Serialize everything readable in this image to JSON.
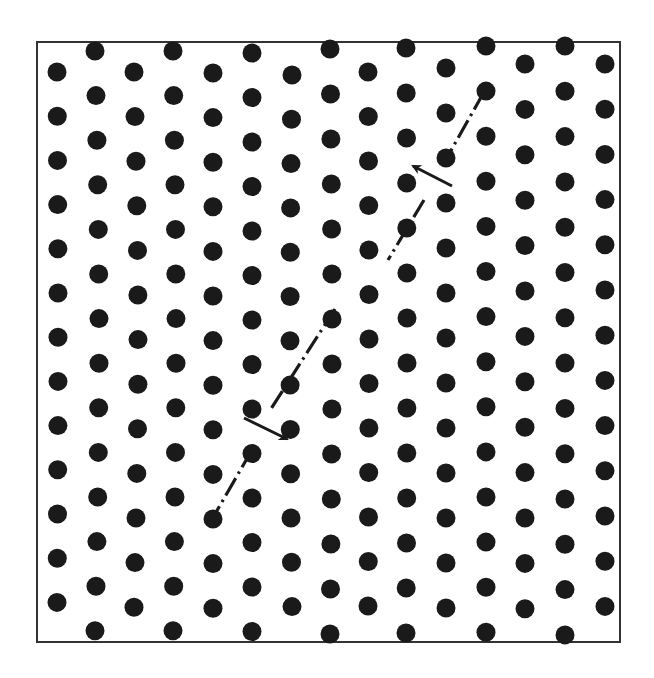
{
  "figure": {
    "frame": {
      "x": 37,
      "y": 42,
      "width": 583,
      "height": 600
    },
    "colors": {
      "ink": "#1a1a1a",
      "background": "#ffffff",
      "frame": "#333333"
    },
    "dot_radius": 9.5,
    "columns": [
      {
        "x": 57,
        "y0": 72,
        "count": 13,
        "dy": 44.2,
        "drift": 1.0
      },
      {
        "x": 95,
        "y0": 51,
        "count": 14,
        "dy": 44.6,
        "drift": 4.0
      },
      {
        "x": 134,
        "y0": 72,
        "count": 13,
        "dy": 44.6,
        "drift": 4.0
      },
      {
        "x": 173,
        "y0": 51,
        "count": 14,
        "dy": 44.6,
        "drift": 3.0
      },
      {
        "x": 213,
        "y0": 73,
        "count": 13,
        "dy": 44.6,
        "drift": 0.0
      },
      {
        "x": 252,
        "y0": 53,
        "count": 14,
        "dy": 44.5,
        "drift": 0.0
      },
      {
        "x": 292,
        "y0": 75,
        "count": 13,
        "dy": 44.3,
        "drift": -2.0
      },
      {
        "x": 330,
        "y0": 49,
        "count": 14,
        "dy": 45.0,
        "drift": 2.0
      },
      {
        "x": 368,
        "y0": 72,
        "count": 13,
        "dy": 44.5,
        "drift": 1.0
      },
      {
        "x": 406,
        "y0": 48,
        "count": 14,
        "dy": 45.0,
        "drift": 1.0
      },
      {
        "x": 446,
        "y0": 68,
        "count": 13,
        "dy": 45.0,
        "drift": 0.0
      },
      {
        "x": 486,
        "y0": 46,
        "count": 14,
        "dy": 45.1,
        "drift": 0.0
      },
      {
        "x": 525,
        "y0": 64,
        "count": 13,
        "dy": 45.4,
        "drift": 0.0
      },
      {
        "x": 565,
        "y0": 46,
        "count": 14,
        "dy": 45.3,
        "drift": 0.0
      },
      {
        "x": 605,
        "y0": 64,
        "count": 13,
        "dy": 45.2,
        "drift": 0.0
      }
    ],
    "slip_lines": [
      {
        "name": "upper-slip-segment-a",
        "x1": 484,
        "y1": 92,
        "x2": 449,
        "y2": 154
      },
      {
        "name": "upper-slip-segment-b",
        "x1": 424,
        "y1": 200,
        "x2": 388,
        "y2": 260
      },
      {
        "name": "middle-slip-segment",
        "x1": 335,
        "y1": 309,
        "x2": 269,
        "y2": 412
      },
      {
        "name": "lower-slip-segment",
        "x1": 252,
        "y1": 450,
        "x2": 215,
        "y2": 514
      }
    ],
    "arrows": [
      {
        "name": "upper-arrow",
        "direction": "up-left",
        "x1": 452,
        "y1": 186,
        "x2": 413,
        "y2": 166
      },
      {
        "name": "lower-arrow",
        "direction": "down-right",
        "x1": 244,
        "y1": 418,
        "x2": 287,
        "y2": 439
      }
    ]
  }
}
